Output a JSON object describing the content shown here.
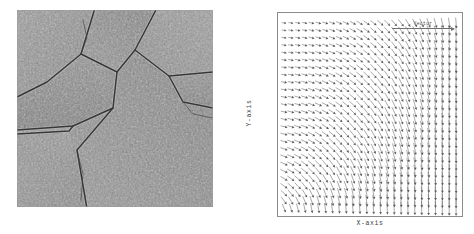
{
  "figure": {
    "background_color": "#ffffff",
    "panels": [
      {
        "id": "crack-texture",
        "kind": "image",
        "description": "Grayscale micrograph of a cracked stone-like surface showing a polygonal crack network"
      },
      {
        "id": "vector-field",
        "kind": "quiver-plot",
        "description": "Arrow/quiver plot of a 2D vector field on a regular grid"
      }
    ]
  },
  "left_panel": {
    "title": "",
    "image_name": "crack-texture-image",
    "border_color": "#9a9a9a",
    "base_gray": "#8e8e8e"
  },
  "right_panel": {
    "xlabel": "X-axis",
    "ylabel": "Y-axis",
    "frame_color": "#8c8c8c",
    "arrow_color": "#555555",
    "legend": {
      "label": "Vector",
      "show_reference_arrow": true
    }
  },
  "chart_data": {
    "type": "scatter",
    "subtype": "quiver",
    "title": "",
    "xlabel": "X-axis",
    "ylabel": "Y-axis",
    "grid": false,
    "legend_position": "top-right",
    "xlim": [
      0,
      1
    ],
    "ylim": [
      0,
      1
    ],
    "xticks": [],
    "yticks": [],
    "grid_cols": 26,
    "grid_rows": 26,
    "annotations": [
      "Vector"
    ],
    "field_model": {
      "description": "Arrows rotate smoothly from up-right in the upper-left corner to straight-down on the right edge and lower region; magnitude grows toward the right and bottom edges.",
      "u_expression": "cos(theta)",
      "v_expression": "sin(theta)",
      "theta_expression": "atan2(-(x+0.25), (1.05 - x) * (1.05 - y) * 1.6) ",
      "magnitude_expression": "0.45 + 0.85 * (0.55*x + 0.45*(1-y))"
    }
  }
}
